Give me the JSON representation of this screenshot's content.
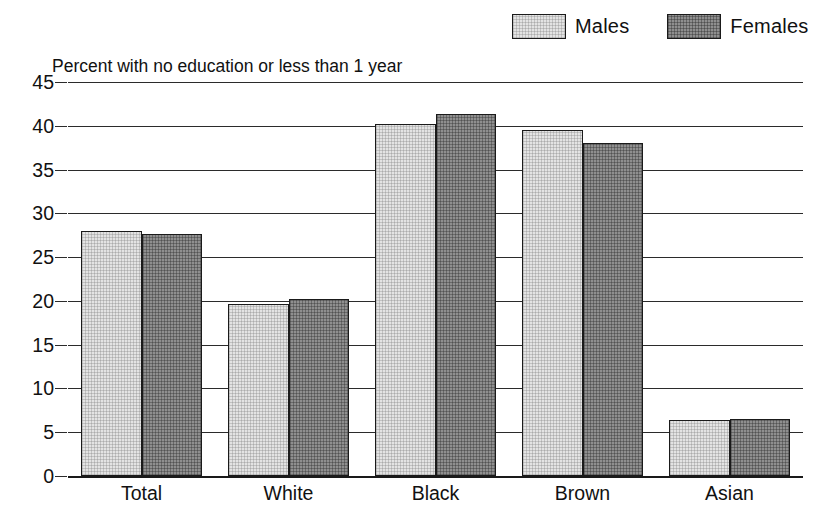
{
  "chart_data": {
    "type": "bar",
    "title": "Percent with no education or less than 1 year",
    "xlabel": "",
    "ylabel": "",
    "ylim": [
      0,
      45
    ],
    "ytick_step": 5,
    "yticks": [
      "0",
      "5",
      "10",
      "15",
      "20",
      "25",
      "30",
      "35",
      "40",
      "45"
    ],
    "grid": true,
    "legend_position": "top-right",
    "categories": [
      "Total",
      "White",
      "Black",
      "Brown",
      "Asian"
    ],
    "series": [
      {
        "name": "Males",
        "values": [
          28.0,
          19.7,
          40.2,
          39.5,
          6.4
        ]
      },
      {
        "name": "Females",
        "values": [
          27.6,
          20.2,
          41.3,
          38.0,
          6.5
        ]
      }
    ],
    "colors": {
      "males": "#e3e3e3",
      "females": "#8f8f8f",
      "outline": "#1a1a1a",
      "gridline": "#2b2b2b",
      "background": "#ffffff"
    }
  },
  "legend": {
    "entries": [
      {
        "label": "Males",
        "swatch": "males-swatch"
      },
      {
        "label": "Females",
        "swatch": "females-swatch"
      }
    ]
  }
}
